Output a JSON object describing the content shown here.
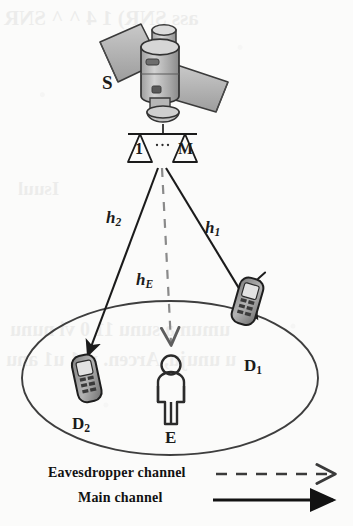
{
  "figure": {
    "type": "system-model-diagram",
    "background_color": "#fbfbfa",
    "ink_color": "#1b1b1b"
  },
  "nodes": {
    "satellite": {
      "label": "S",
      "name": "satellite",
      "antennas": [
        {
          "label": "1"
        },
        {
          "label": "M"
        }
      ],
      "antenna_ellipsis": "..."
    },
    "destination_1": {
      "label": "D",
      "subscript": "1",
      "icon": "mobile-phone-icon"
    },
    "destination_2": {
      "label": "D",
      "subscript": "2",
      "icon": "mobile-phone-icon"
    },
    "eavesdropper": {
      "label": "E",
      "icon": "person-icon"
    }
  },
  "channels": [
    {
      "id": "h1",
      "label": "h",
      "subscript": "1",
      "style": "solid",
      "from": "satellite",
      "to": "destination_1"
    },
    {
      "id": "h2",
      "label": "h",
      "subscript": "2",
      "style": "solid",
      "from": "satellite",
      "to": "destination_2"
    },
    {
      "id": "hE",
      "label": "h",
      "subscript": "E",
      "style": "dashed",
      "from": "satellite",
      "to": "eavesdropper"
    }
  ],
  "coverage_area": {
    "name": "coverage-ellipse",
    "shape": "ellipse"
  },
  "legend": {
    "items": [
      {
        "label": "Eavesdropper channel",
        "line_style": "dashed",
        "arrow": "thin"
      },
      {
        "label": "Main channel",
        "line_style": "solid",
        "arrow": "bold"
      }
    ]
  }
}
